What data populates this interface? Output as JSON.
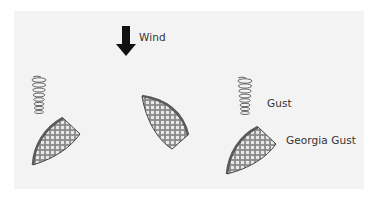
{
  "diagram": {
    "labels": {
      "wind": "Wind",
      "gust": "Gust",
      "georgia_gust": "Georgia Gust"
    },
    "colors": {
      "background": "#ffffff",
      "panel": "#f3f3f3",
      "arrow": "#111111",
      "text": "#333333",
      "spring": "#555555",
      "shape_edge": "#444444",
      "shape_fill_light": "#e6e6e6",
      "shape_fill_dark": "#8a8a8a"
    },
    "elements": [
      {
        "id": "wind-arrow",
        "direction": "down"
      },
      {
        "id": "left-spring"
      },
      {
        "id": "left-shape"
      },
      {
        "id": "middle-shape"
      },
      {
        "id": "right-spring",
        "label": "Gust"
      },
      {
        "id": "right-shape",
        "label": "Georgia Gust"
      }
    ]
  }
}
